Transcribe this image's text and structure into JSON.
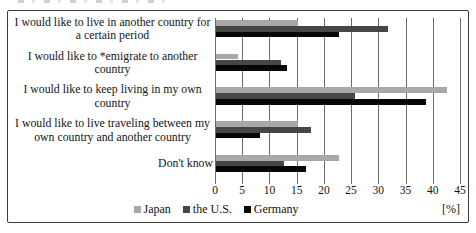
{
  "chart_data": {
    "type": "bar",
    "orientation": "horizontal",
    "title": "",
    "categories": [
      "I would like to live in another country for a certain period",
      "I would like to *emigrate to another country",
      "I would like to keep living in my own country",
      "I would like to live traveling between my own country and another country",
      "Don't know"
    ],
    "series": [
      {
        "name": "Japan",
        "color": "#a8a8a8",
        "values": [
          15,
          4,
          42.5,
          15,
          22.5
        ]
      },
      {
        "name": "the U.S.",
        "color": "#464646",
        "values": [
          31.5,
          12,
          25.5,
          17.5,
          12.5
        ]
      },
      {
        "name": "Germany",
        "color": "#070707",
        "values": [
          22.5,
          13,
          38.5,
          8,
          16.5
        ]
      }
    ],
    "xlim": [
      0,
      45
    ],
    "xticks": [
      0,
      5,
      10,
      15,
      20,
      25,
      30,
      35,
      40,
      45
    ],
    "unit_label": "[%]",
    "legend_position": "bottom",
    "grid": "vertical",
    "gridline_color": "#6b6b6b",
    "frame_border_color": "#3c3c3c"
  }
}
